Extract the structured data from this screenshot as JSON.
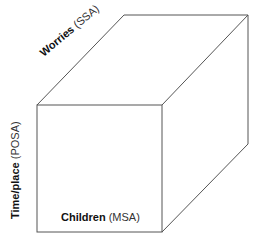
{
  "diagram": {
    "type": "3d-cube",
    "axes": [
      {
        "id": "worries",
        "label": "Worries",
        "abbrev": "(SSA)",
        "orientation": "depth"
      },
      {
        "id": "time-place",
        "label": "Time/place",
        "abbrev": "(POSA)",
        "orientation": "vertical"
      },
      {
        "id": "children",
        "label": "Children",
        "abbrev": "(MSA)",
        "orientation": "horizontal"
      }
    ],
    "colors": {
      "line": "#555555",
      "background": "#ffffff",
      "text": "#222222"
    }
  }
}
